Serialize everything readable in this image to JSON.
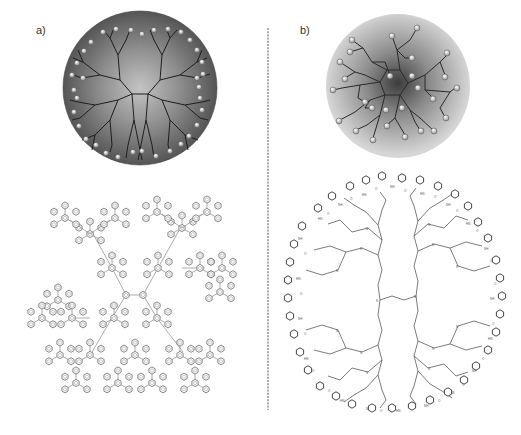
{
  "figure": {
    "panels": [
      {
        "id": "a",
        "label": "a)",
        "schematic": {
          "shape": "sphere",
          "fill_outer": "#5a5a5a",
          "fill_inner": "#b8b8b8",
          "branch_color": "#222222",
          "end_group_fill": "#e8e8e8",
          "end_group_count": 40,
          "core_branches": 4,
          "description": "dense-shell dendrimer with end groups at periphery"
        },
        "structure": {
          "type": "polyphenylene dendrimer",
          "unit": "benzene ring",
          "line_color": "#777777"
        }
      },
      {
        "id": "b",
        "label": "b)",
        "schematic": {
          "shape": "sphere",
          "fill_outer": "#d4d4d4",
          "fill_inner": "#4a4a4a",
          "branch_color": "#333333",
          "end_group_fill": "#cfcfcf",
          "description": "dense-core dendrimer with back-folded end groups"
        },
        "structure": {
          "type": "PAMAM dendrimer with phenylurea end groups",
          "atom_labels": [
            "N",
            "NH",
            "HN",
            "O",
            "H"
          ],
          "line_color": "#444444"
        }
      }
    ],
    "divider": {
      "style": "dashed",
      "color": "#555555"
    }
  }
}
